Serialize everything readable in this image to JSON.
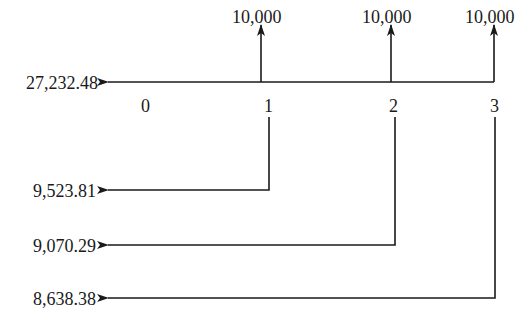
{
  "diagram": {
    "type": "cash-flow-timeline",
    "present_value_total": "27,232.48",
    "time_points": [
      "0",
      "1",
      "2",
      "3"
    ],
    "cash_flows": [
      {
        "period": "1",
        "amount": "10,000",
        "present_value": "9,523.81"
      },
      {
        "period": "2",
        "amount": "10,000",
        "present_value": "9,070.29"
      },
      {
        "period": "3",
        "amount": "10,000",
        "present_value": "8,638.38"
      }
    ],
    "line_color": "#1a1a1a"
  }
}
